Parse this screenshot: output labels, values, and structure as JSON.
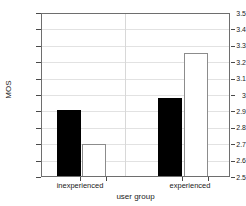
{
  "chart_data": {
    "type": "bar",
    "title": "",
    "xlabel": "user group",
    "ylabel": "MOS",
    "ylim": [
      2.5,
      3.5
    ],
    "yticks": [
      "2.5",
      "2.6",
      "2.7",
      "2.8",
      "2.9",
      "3",
      "3.1",
      "3.2",
      "3.3",
      "3.4",
      "3.5"
    ],
    "categories": [
      "inexperienced",
      "experienced"
    ],
    "grid": true,
    "legend": "none",
    "series": [
      {
        "name": "black",
        "values": [
          2.91,
          2.98
        ],
        "color": "#000000"
      },
      {
        "name": "white",
        "values": [
          2.7,
          3.26
        ],
        "color": "#ffffff"
      }
    ],
    "bars": [
      {
        "group": "inexperienced",
        "series": "black",
        "value": 2.91
      },
      {
        "group": "inexperienced",
        "series": "white",
        "value": 2.7
      },
      {
        "group": "experienced",
        "series": "black",
        "value": 2.98
      },
      {
        "group": "experienced",
        "series": "white",
        "value": 3.26
      }
    ]
  },
  "axes": {
    "y_tick_0": "2.5",
    "y_tick_1": "2.6",
    "y_tick_2": "2.7",
    "y_tick_3": "2.8",
    "y_tick_4": "2.9",
    "y_tick_5": "3",
    "y_tick_6": "3.1",
    "y_tick_7": "3.2",
    "y_tick_8": "3.3",
    "y_tick_9": "3.4",
    "y_tick_10": "3.5",
    "x_tick_0": "inexperienced",
    "x_tick_1": "experienced",
    "x_title": "user group",
    "y_title": "MOS"
  }
}
